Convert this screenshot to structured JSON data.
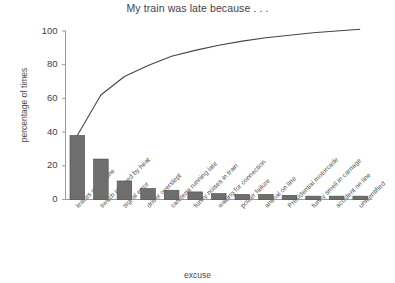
{
  "chart_data": {
    "type": "bar",
    "title": "My train was late because . . .",
    "xlabel": "excuse",
    "ylabel": "percentage of times",
    "ylim": [
      0,
      100
    ],
    "yticks": [
      0,
      20,
      40,
      60,
      80,
      100
    ],
    "grid": false,
    "legend": "none",
    "categories": [
      "leaves on the line",
      "switch jammed by heat",
      "signal error",
      "driver overslept",
      "cafeteria running late",
      "funny noises in train",
      "waiting for connection",
      "power failure",
      "animal on line",
      "Presidential motorcade",
      "funny smell in carriage",
      "accident on line",
      "unidentified"
    ],
    "values": [
      38,
      24,
      11,
      6.5,
      5.5,
      4.5,
      3.5,
      3,
      3,
      2.5,
      2,
      2,
      2
    ],
    "series": [
      {
        "name": "percentage of times",
        "type": "bar",
        "values": [
          38,
          24,
          11,
          6.5,
          5.5,
          4.5,
          3.5,
          3,
          3,
          2.5,
          2,
          2,
          2
        ]
      },
      {
        "name": "cumulative percentage",
        "type": "line",
        "values": [
          38,
          62,
          73,
          79.5,
          85,
          89.5,
          93,
          96,
          99,
          101.5,
          103.5,
          105.5,
          107.5
        ]
      }
    ],
    "cumulative_plotted": [
      38,
      62,
      73,
      79.5,
      85,
      88.5,
      91.5,
      94,
      96,
      97.5,
      99,
      100,
      101
    ],
    "colors": {
      "bar_fill": "#6e6e6e",
      "bar_edge": "#4a4a4a",
      "line": "#444444",
      "axis": "#9a9a9a",
      "text": "#3f3f3f"
    }
  }
}
